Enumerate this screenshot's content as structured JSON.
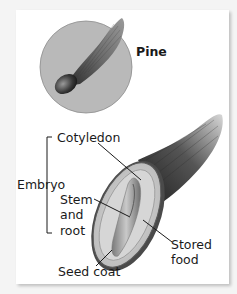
{
  "figure": {
    "inset": {
      "label": "Pine",
      "circle_fill": "#b9b9b9"
    },
    "labels": {
      "cotyledon": "Cotyledon",
      "embryo": "Embryo",
      "stem_line1": "Stem",
      "stem_line2": "and",
      "stem_line3": "root",
      "seed_coat": "Seed coat",
      "stored_line1": "Stored",
      "stored_line2": "food"
    },
    "colors": {
      "panel": "#ffffff",
      "background": "#f4f4f4",
      "text": "#1a1a1a",
      "leader": "#1a1a1a"
    }
  }
}
